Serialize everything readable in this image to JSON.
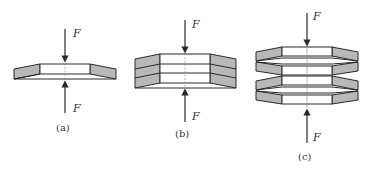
{
  "diagram": {
    "colors": {
      "stroke": "#2a2a2a",
      "fill_shaded": "#b8b8b8",
      "fill_inner": "#ffffff",
      "axis": "#888888"
    },
    "force_label": "F",
    "panels": [
      {
        "id": "a",
        "caption": "(a)",
        "description": "single disc spring under axial load F"
      },
      {
        "id": "b",
        "caption": "(b)",
        "description": "three disc springs stacked in parallel (same orientation)"
      },
      {
        "id": "c",
        "caption": "(c)",
        "description": "disc springs stacked in series (alternating orientation), pairs nested"
      }
    ]
  }
}
